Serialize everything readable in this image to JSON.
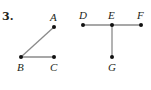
{
  "problem_number": "3.",
  "figures": [
    {
      "name": "angle-ABC",
      "points": [
        {
          "label": "A",
          "x": 54,
          "y": 27
        },
        {
          "label": "B",
          "x": 21,
          "y": 57
        },
        {
          "label": "C",
          "x": 54,
          "y": 57
        }
      ],
      "segments": [
        [
          "B",
          "A"
        ],
        [
          "B",
          "C"
        ]
      ]
    },
    {
      "name": "T-shape-DEFG",
      "points": [
        {
          "label": "D",
          "x": 83,
          "y": 25
        },
        {
          "label": "E",
          "x": 112,
          "y": 25
        },
        {
          "label": "F",
          "x": 141,
          "y": 25
        },
        {
          "label": "G",
          "x": 112,
          "y": 57
        }
      ],
      "segments": [
        [
          "D",
          "E"
        ],
        [
          "E",
          "F"
        ],
        [
          "E",
          "G"
        ]
      ]
    }
  ],
  "colors": {
    "segment": "#8a8a8a",
    "point": "#111111",
    "text": "#231f20"
  }
}
